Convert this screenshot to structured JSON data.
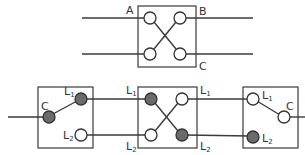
{
  "colors": {
    "line": "#3a3a3a",
    "terminal_open_fill": "#ffffff",
    "terminal_closed_fill": "#6b6b6b",
    "background": "#ffffff"
  },
  "top_switch": {
    "type": "intermediate-switch-symbol",
    "labels": {
      "a": "A",
      "b": "B",
      "c": "C"
    }
  },
  "bottom_circuit": {
    "left_switch": {
      "type": "two-way-switch",
      "common_label": "C",
      "l1_label": "L",
      "l1_sub": "1",
      "l2_label": "L",
      "l2_sub": "2",
      "position": "L1"
    },
    "middle_switch": {
      "type": "intermediate-switch",
      "left_l1_label": "L",
      "left_l1_sub": "1",
      "left_l2_label": "L",
      "left_l2_sub": "2",
      "right_l1_label": "L",
      "right_l1_sub": "1",
      "right_l2_label": "L",
      "right_l2_sub": "2",
      "position": "crossed"
    },
    "right_switch": {
      "type": "two-way-switch",
      "common_label": "C",
      "l1_label": "L",
      "l1_sub": "1",
      "l2_label": "L",
      "l2_sub": "2",
      "position": "L1"
    }
  }
}
